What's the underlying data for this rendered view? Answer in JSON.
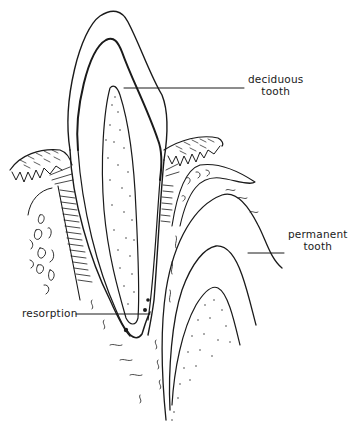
{
  "figure": {
    "type": "anatomical line drawing",
    "colors": {
      "ink": "#1a1a1a",
      "background": "#ffffff"
    }
  },
  "labels": {
    "deciduous": {
      "line1": "deciduous",
      "line2": "tooth"
    },
    "permanent": {
      "line1": "permanent",
      "line2": "tooth"
    },
    "resorption": {
      "text": "resorption"
    }
  }
}
